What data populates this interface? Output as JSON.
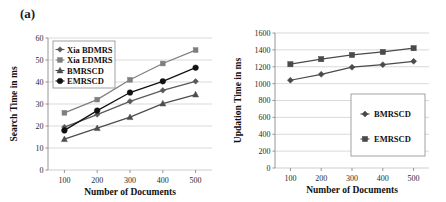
{
  "figure": {
    "panels": [
      {
        "label": "(a)"
      },
      {
        "label": "(b)"
      }
    ]
  },
  "chart_data": [
    {
      "type": "line",
      "panel_label": "(a)",
      "title": "",
      "xlabel": "Number of Documents",
      "ylabel": "Search Time in ms",
      "x": [
        100,
        200,
        300,
        400,
        500
      ],
      "xticklabels": [
        "100",
        "200",
        "300",
        "400",
        "500"
      ],
      "yticklabels": [
        "0",
        "10",
        "20",
        "30",
        "40",
        "50",
        "60"
      ],
      "xlim": [
        50,
        550
      ],
      "ylim": [
        0,
        60
      ],
      "grid": "horizontal",
      "legend_position": "upper-left",
      "series": [
        {
          "name": "Xia BDMRS",
          "marker": "diamond",
          "color": "#595959",
          "values": [
            19.5,
            25.2,
            31.2,
            36.2,
            40.3
          ]
        },
        {
          "name": "Xia EDMRS",
          "marker": "square",
          "color": "#7f7f7f",
          "values": [
            26.0,
            32.0,
            41.0,
            48.4,
            54.5
          ]
        },
        {
          "name": "BMRSCD",
          "marker": "triangle",
          "color": "#4d4d4d",
          "values": [
            14.0,
            19.0,
            24.0,
            30.2,
            34.3
          ]
        },
        {
          "name": "EMRSCD",
          "marker": "circle",
          "color": "#111111",
          "values": [
            18.0,
            27.0,
            35.2,
            40.3,
            46.5
          ]
        }
      ]
    },
    {
      "type": "line",
      "panel_label": "(b)",
      "title": "",
      "xlabel": "Number of Documents",
      "ylabel": "Updation Time in ms",
      "x": [
        100,
        200,
        300,
        400,
        500
      ],
      "xticklabels": [
        "100",
        "200",
        "300",
        "400",
        "500"
      ],
      "yticklabels": [
        "0",
        "200",
        "400",
        "600",
        "800",
        "1000",
        "1200",
        "1400",
        "1600"
      ],
      "xlim": [
        50,
        550
      ],
      "ylim": [
        0,
        1600
      ],
      "grid": "horizontal",
      "legend_position": "lower-right",
      "series": [
        {
          "name": "BMRSCD",
          "marker": "diamond",
          "color": "#4a4a4a",
          "values": [
            1040,
            1110,
            1195,
            1225,
            1265
          ]
        },
        {
          "name": "EMRSCD",
          "marker": "square",
          "color": "#4a4a4a",
          "values": [
            1230,
            1290,
            1340,
            1375,
            1420
          ]
        }
      ]
    }
  ]
}
